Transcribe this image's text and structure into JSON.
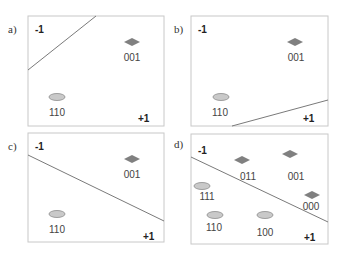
{
  "figure": {
    "title": "",
    "colors": {
      "frame": "#c8c8c8",
      "line": "#7a7a7a",
      "diamond_fill": "#808080",
      "ellipse_fill": "#c9c9c9",
      "ellipse_stroke": "#8c8c8c",
      "text": "#333333"
    },
    "panels": [
      {
        "id": "a",
        "label": "a)",
        "neg_label": "-1",
        "pos_label": "+1",
        "points": [
          {
            "code": "001",
            "shape": "diamond",
            "class": "-1"
          },
          {
            "code": "110",
            "shape": "ellipse",
            "class": "+1"
          }
        ]
      },
      {
        "id": "b",
        "label": "b)",
        "neg_label": "-1",
        "pos_label": "+1",
        "points": [
          {
            "code": "001",
            "shape": "diamond",
            "class": "-1"
          },
          {
            "code": "110",
            "shape": "ellipse",
            "class": "-1"
          }
        ]
      },
      {
        "id": "c",
        "label": "c)",
        "neg_label": "-1",
        "pos_label": "+1",
        "points": [
          {
            "code": "001",
            "shape": "diamond",
            "class": "-1"
          },
          {
            "code": "110",
            "shape": "ellipse",
            "class": "+1"
          }
        ]
      },
      {
        "id": "d",
        "label": "d)",
        "neg_label": "-1",
        "pos_label": "+1",
        "points": [
          {
            "code": "011",
            "shape": "diamond",
            "class": "-1"
          },
          {
            "code": "001",
            "shape": "diamond",
            "class": "-1"
          },
          {
            "code": "111",
            "shape": "ellipse",
            "class": "+1"
          },
          {
            "code": "000",
            "shape": "diamond",
            "class": "-1"
          },
          {
            "code": "110",
            "shape": "ellipse",
            "class": "+1"
          },
          {
            "code": "100",
            "shape": "ellipse",
            "class": "+1"
          }
        ]
      }
    ]
  }
}
